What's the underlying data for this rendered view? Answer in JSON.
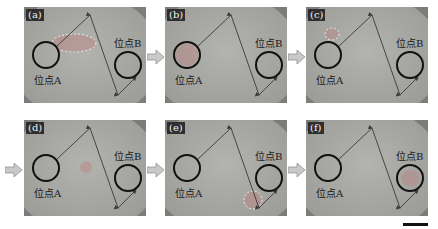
{
  "figure": {
    "panels": [
      {
        "id": "a",
        "label": "(a)",
        "site_a": "位点A",
        "site_b": "位点B",
        "droplet": "between-A-and-path",
        "x": 24,
        "y": 7,
        "w": 122,
        "h": 96
      },
      {
        "id": "b",
        "label": "(b)",
        "site_a": "位点A",
        "site_b": "位点B",
        "droplet": "inside-A",
        "x": 165,
        "y": 7,
        "w": 122,
        "h": 96
      },
      {
        "id": "c",
        "label": "(c)",
        "site_a": "位点A",
        "site_b": "位点B",
        "droplet": "top-of-A",
        "x": 306,
        "y": 7,
        "w": 122,
        "h": 96
      },
      {
        "id": "d",
        "label": "(d)",
        "site_a": "位点A",
        "site_b": "位点B",
        "droplet": "middle",
        "x": 24,
        "y": 120,
        "w": 122,
        "h": 96
      },
      {
        "id": "e",
        "label": "(e)",
        "site_a": "位点A",
        "site_b": "位点B",
        "droplet": "below-B",
        "x": 165,
        "y": 120,
        "w": 122,
        "h": 96
      },
      {
        "id": "f",
        "label": "(f)",
        "site_a": "位点A",
        "site_b": "位点B",
        "droplet": "inside-B",
        "x": 306,
        "y": 120,
        "w": 122,
        "h": 96
      }
    ],
    "arrows": [
      {
        "from": "a",
        "to": "b",
        "x": 147,
        "y": 49
      },
      {
        "from": "b",
        "to": "c",
        "x": 288,
        "y": 49
      },
      {
        "from": "c",
        "to": "d",
        "x": 5,
        "y": 162
      },
      {
        "from": "d",
        "to": "e",
        "x": 147,
        "y": 162
      },
      {
        "from": "e",
        "to": "f",
        "x": 288,
        "y": 162
      }
    ],
    "scale_bar": {
      "label": ""
    },
    "colors": {
      "plate": "#a3a3a0",
      "circle": "#111111",
      "path": "#3a3a3a",
      "droplet": "#b88a86",
      "arrow": "#c9c9c9"
    }
  }
}
